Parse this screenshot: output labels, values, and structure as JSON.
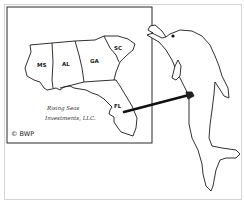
{
  "cartoon": {
    "subject": "dolphin pointing at map",
    "map": {
      "states": [
        {
          "abbr": "MS"
        },
        {
          "abbr": "AL"
        },
        {
          "abbr": "GA"
        },
        {
          "abbr": "SC"
        },
        {
          "abbr": "FL"
        }
      ],
      "company_line1": "Rising Seas",
      "company_line2": "Investments, LLC."
    },
    "copyright": "© BWP",
    "colors": {
      "ink": "#1a1a1a",
      "frame": "#cfcfcf",
      "background": "#ffffff"
    }
  }
}
